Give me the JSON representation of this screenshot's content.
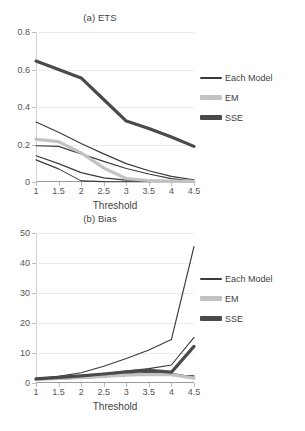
{
  "figure": {
    "panels": [
      "a",
      "b"
    ]
  },
  "chart_data": [
    {
      "type": "line",
      "title": "(a) ETS",
      "xlabel": "Threshold",
      "ylabel": "",
      "x": [
        1,
        1.5,
        2,
        2.5,
        3,
        3.5,
        4,
        4.5
      ],
      "xticklabels": [
        "1",
        "1.5",
        "2",
        "2.5",
        "3",
        "3.5",
        "4",
        "4.5"
      ],
      "xlim": [
        1,
        4.5
      ],
      "ylim": [
        0,
        0.8
      ],
      "yticks": [
        0,
        0.2,
        0.4,
        0.6,
        0.8
      ],
      "yticklabels": [
        "0",
        "0.2",
        "0.4",
        "0.6",
        "0.8"
      ],
      "grid": true,
      "legend_position": "right",
      "series": [
        {
          "name": "Each Model",
          "style": "thin",
          "color": "#3a3a3a",
          "values": [
            0.32,
            0.265,
            0.205,
            0.15,
            0.098,
            0.06,
            0.03,
            0.012
          ]
        },
        {
          "name": "Each Model",
          "style": "thin",
          "color": "#3a3a3a",
          "values": [
            0.193,
            0.19,
            0.15,
            0.11,
            0.072,
            0.043,
            0.018,
            0.005
          ]
        },
        {
          "name": "Each Model",
          "style": "thin",
          "color": "#3a3a3a",
          "values": [
            0.14,
            0.098,
            0.05,
            0.022,
            0.01,
            0.006,
            0.004,
            0.003
          ]
        },
        {
          "name": "Each Model",
          "style": "thin",
          "color": "#3a3a3a",
          "values": [
            0.118,
            0.07,
            0.006,
            0.002,
            0.001,
            0.001,
            0.001,
            0.001
          ]
        },
        {
          "name": "EM",
          "style": "thick-light",
          "color": "#c2c2c2",
          "values": [
            0.228,
            0.215,
            0.155,
            0.075,
            0.018,
            0.008,
            0.005,
            0.003
          ]
        },
        {
          "name": "SSE",
          "style": "thick-dark",
          "color": "#4a4a4a",
          "values": [
            0.645,
            0.6,
            0.555,
            0.44,
            0.325,
            0.285,
            0.24,
            0.19
          ]
        }
      ],
      "legend": [
        "Each Model",
        "EM",
        "SSE"
      ]
    },
    {
      "type": "line",
      "title": "(b) Bias",
      "xlabel": "Threshold",
      "ylabel": "",
      "x": [
        1,
        1.5,
        2,
        2.5,
        3,
        3.5,
        4,
        4.5
      ],
      "xticklabels": [
        "1",
        "1.5",
        "2",
        "2.5",
        "3",
        "3.5",
        "4",
        "4.5"
      ],
      "xlim": [
        1,
        4.5
      ],
      "ylim": [
        0,
        50
      ],
      "yticks": [
        0,
        10,
        20,
        30,
        40,
        50
      ],
      "yticklabels": [
        "0",
        "10",
        "20",
        "30",
        "40",
        "50"
      ],
      "grid": true,
      "legend_position": "right",
      "series": [
        {
          "name": "Each Model",
          "style": "thin",
          "color": "#3a3a3a",
          "values": [
            1.5,
            2.2,
            3.4,
            5.6,
            8.2,
            11.0,
            14.5,
            45.5
          ]
        },
        {
          "name": "Each Model",
          "style": "thin",
          "color": "#3a3a3a",
          "values": [
            1.3,
            1.8,
            2.3,
            3.1,
            4.0,
            4.8,
            6.0,
            15.2
          ]
        },
        {
          "name": "Each Model",
          "style": "thin",
          "color": "#3a3a3a",
          "values": [
            1.2,
            1.5,
            1.9,
            2.4,
            3.0,
            3.6,
            3.2,
            2.0
          ]
        },
        {
          "name": "Each Model",
          "style": "thin",
          "color": "#3a3a3a",
          "values": [
            1.1,
            1.3,
            1.6,
            2.0,
            2.5,
            2.9,
            2.6,
            2.4
          ]
        },
        {
          "name": "EM",
          "style": "thick-light",
          "color": "#c2c2c2",
          "values": [
            1.2,
            1.5,
            1.8,
            2.2,
            2.6,
            2.9,
            2.8,
            1.6
          ]
        },
        {
          "name": "SSE",
          "style": "thick-dark",
          "color": "#4a4a4a",
          "values": [
            1.4,
            1.9,
            2.4,
            3.0,
            3.7,
            4.2,
            3.6,
            12.2
          ]
        }
      ],
      "legend": [
        "Each Model",
        "EM",
        "SSE"
      ]
    }
  ]
}
